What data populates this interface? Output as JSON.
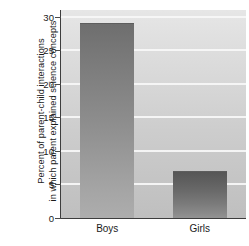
{
  "chart_data": {
    "type": "bar",
    "title": "",
    "xlabel": "",
    "ylabel_line1": "Percent of parent-child interactions",
    "ylabel_line2": "in which parent explained science concepts",
    "categories": [
      "Boys",
      "Girls"
    ],
    "values": [
      29,
      7
    ],
    "ylim": [
      0,
      31
    ],
    "yticks": [
      0,
      5,
      10,
      15,
      20,
      25,
      30
    ],
    "ytick_labels": [
      "0",
      "5",
      "10",
      "15",
      "20",
      "25",
      "30"
    ],
    "grid": true,
    "grid_axis": "y",
    "legend": "none",
    "series": [
      {
        "name": "Percent of parent-child interactions in which parent explained science concepts",
        "values": [
          29,
          7
        ]
      }
    ],
    "colors": {
      "plot_background_top": "#e6e6e6",
      "plot_background_bottom": "#bfbfbf",
      "gridline": "#f7f7f7",
      "bar_top": "#6e6e6e",
      "bar_bottom": "#adadad",
      "axis": "#3d3d3d",
      "text": "#1b1b1b",
      "figure_background": "#ffffff"
    }
  }
}
